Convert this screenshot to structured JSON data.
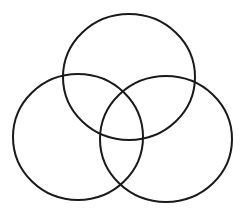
{
  "diagram": {
    "type": "venn",
    "set_count": 3,
    "background_color": "#ffffff",
    "stroke_color": "#1a1a1a",
    "stroke_width": 2,
    "labels": [],
    "sets": [
      {
        "id": "top",
        "cx": 129,
        "cy": 77,
        "rx": 66,
        "ry": 63
      },
      {
        "id": "left",
        "cx": 78,
        "cy": 137,
        "rx": 65,
        "ry": 63
      },
      {
        "id": "right",
        "cx": 166,
        "cy": 139,
        "rx": 66,
        "ry": 63
      }
    ]
  }
}
